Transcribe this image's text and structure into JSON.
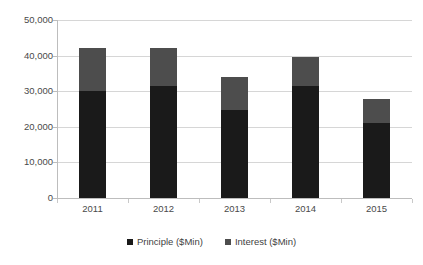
{
  "chart_data": {
    "type": "bar",
    "subtype": "stacked-column",
    "title": "",
    "subtitle": "",
    "xlabel": "",
    "ylabel": "",
    "categories": [
      "2011",
      "2012",
      "2013",
      "2014",
      "2015"
    ],
    "series": [
      {
        "name": "Principle ($Min)",
        "color": "#1a1a1a",
        "values": [
          30000,
          31600,
          24800,
          31500,
          21000
        ]
      },
      {
        "name": "Interest ($Min)",
        "color": "#4d4d4d",
        "values": [
          12000,
          10600,
          9200,
          8000,
          6800
        ]
      }
    ],
    "totals": [
      42000,
      42200,
      34000,
      39500,
      27800
    ],
    "ylim": [
      0,
      50000
    ],
    "ytick_values": [
      0,
      10000,
      20000,
      30000,
      40000,
      50000
    ],
    "ytick_labels": [
      "0",
      "10,000",
      "20,000",
      "30,000",
      "40,000",
      "50,000"
    ],
    "grid": true,
    "grid_axis": "y",
    "legend_position": "bottom"
  },
  "legend": {
    "items": [
      {
        "label": "Principle ($Min)",
        "marker": "square-marker"
      },
      {
        "label": "Interest ($Min)",
        "marker": "square-marker"
      }
    ]
  },
  "colors": {
    "principle": "#1a1a1a",
    "interest": "#4d4d4d",
    "gridline": "#d6d6d6",
    "axis": "#bdbdbd",
    "text": "#4a4a4a",
    "background": "#ffffff"
  }
}
